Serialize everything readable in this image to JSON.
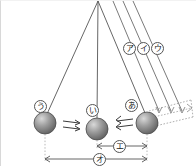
{
  "figure": {
    "type": "pendulum-diagram",
    "background_color": "#ffffff",
    "line_color": "#555555",
    "ball_color": "#8f8f8f",
    "dotted_color": "#999999"
  },
  "pivot": {
    "x": 97,
    "y": 0
  },
  "balls": [
    {
      "name": "ball-u",
      "label": "う",
      "cx": 44,
      "cy": 122,
      "r": 11,
      "label_x": 33,
      "label_y": 99
    },
    {
      "name": "ball-i",
      "label": "い",
      "cx": 96,
      "cy": 128,
      "r": 11,
      "label_x": 85,
      "label_y": 103
    },
    {
      "name": "ball-a",
      "label": "あ",
      "cx": 146,
      "cy": 122,
      "r": 11,
      "label_x": 124,
      "label_y": 98
    }
  ],
  "string_labels": [
    {
      "name": "string-label-a-katakana",
      "label": "ア",
      "x": 122,
      "y": 41
    },
    {
      "name": "string-label-i-katakana",
      "label": "イ",
      "x": 136,
      "y": 41
    },
    {
      "name": "string-label-u-katakana",
      "label": "ウ",
      "x": 150,
      "y": 41
    }
  ],
  "dimension_labels": [
    {
      "name": "dimension-e",
      "label": "エ",
      "x": 112,
      "y": 139
    },
    {
      "name": "dimension-o",
      "label": "オ",
      "x": 92,
      "y": 152
    }
  ],
  "motion_arrows": [
    {
      "name": "arrow-pair-left",
      "direction": "right"
    },
    {
      "name": "arrow-pair-right",
      "direction": "left"
    }
  ]
}
